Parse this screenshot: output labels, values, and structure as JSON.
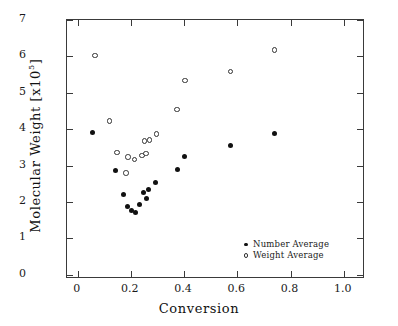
{
  "chart_data": {
    "type": "scatter",
    "title": "",
    "xlabel": "Conversion",
    "ylabel": "Molecular Weight [x10^5]",
    "ylabel_base": "Molecular  Weight  [x10",
    "ylabel_exp": "5",
    "ylabel_close": "]",
    "xlim": [
      -0.04,
      1.08
    ],
    "ylim": [
      -0.12,
      7.0
    ],
    "xticks": [
      0,
      0.2,
      0.4,
      0.6,
      0.8,
      1.0
    ],
    "xtick_labels": [
      "0",
      "0.2",
      "0.4",
      "0.6",
      "0.8",
      "1.0"
    ],
    "yticks": [
      0,
      1,
      2,
      3,
      4,
      5,
      6,
      7
    ],
    "ytick_labels": [
      "0",
      "1",
      "2",
      "3",
      "4",
      "5",
      "6",
      "7"
    ],
    "grid": false,
    "legend_position": "lower right",
    "marker_color": "#111111",
    "frame_color": "#3a3a3a",
    "series": [
      {
        "name": "Number Average",
        "marker": "filled-circle",
        "points": [
          [
            0.057,
            3.92
          ],
          [
            0.143,
            2.85
          ],
          [
            0.171,
            2.21
          ],
          [
            0.189,
            1.88
          ],
          [
            0.201,
            1.75
          ],
          [
            0.219,
            1.71
          ],
          [
            0.232,
            1.93
          ],
          [
            0.247,
            2.26
          ],
          [
            0.258,
            2.09
          ],
          [
            0.266,
            2.34
          ],
          [
            0.293,
            2.53
          ],
          [
            0.375,
            2.88
          ],
          [
            0.403,
            3.26
          ],
          [
            0.573,
            3.56
          ],
          [
            0.738,
            3.89
          ]
        ]
      },
      {
        "name": "Weight Average",
        "marker": "open-circle",
        "points": [
          [
            0.066,
            6.02
          ],
          [
            0.119,
            4.22
          ],
          [
            0.148,
            3.36
          ],
          [
            0.182,
            2.79
          ],
          [
            0.189,
            3.23
          ],
          [
            0.214,
            3.17
          ],
          [
            0.242,
            3.28
          ],
          [
            0.252,
            3.67
          ],
          [
            0.257,
            3.33
          ],
          [
            0.271,
            3.7
          ],
          [
            0.296,
            3.86
          ],
          [
            0.374,
            4.54
          ],
          [
            0.404,
            5.34
          ],
          [
            0.574,
            5.59
          ],
          [
            0.739,
            6.18
          ]
        ]
      }
    ]
  },
  "legend": {
    "items": [
      {
        "label": "Number Average",
        "marker": "filled-circle"
      },
      {
        "label": "Weight Average",
        "marker": "open-circle"
      }
    ]
  }
}
